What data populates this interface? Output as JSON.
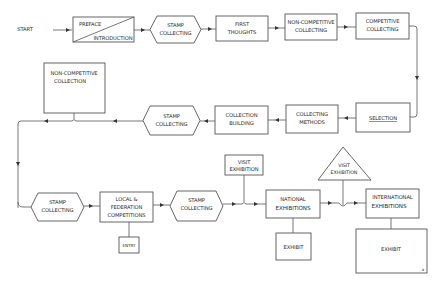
{
  "diagram": {
    "start": "START",
    "preface": {
      "top": "PREFACE",
      "bottom": "INTRODUCTION"
    },
    "stamp1": {
      "l1": "STAMP",
      "l2": "COLLECTING"
    },
    "first_thoughts": {
      "l1": "FIRST",
      "l2": "THOUGHTS"
    },
    "non_comp_collecting": {
      "l1": "NON-COMPETITIVE",
      "l2": "COLLECTING"
    },
    "comp_collecting": {
      "l1": "COMPETITIVE",
      "l2": "COLLECTING"
    },
    "selection": {
      "l1": "SELECTION"
    },
    "collecting_methods": {
      "l1": "COLLECTING",
      "l2": "METHODS"
    },
    "collection_building": {
      "l1": "COLLECTION",
      "l2": "BUILDING"
    },
    "stamp2": {
      "l1": "STAMP",
      "l2": "COLLECTING"
    },
    "non_comp_collection": {
      "l1": "NON-COMPETITIVE",
      "l2": "COLLECTION"
    },
    "stamp3": {
      "l1": "STAMP",
      "l2": "COLLECTING"
    },
    "local_federation": {
      "l1": "LOCAL      &",
      "l2": "FEDERATION",
      "l3": "COMPETITIONS"
    },
    "entry": {
      "l1": "ENTRY"
    },
    "stamp4": {
      "l1": "STAMP",
      "l2": "COLLECTING"
    },
    "visit_exhibition_box": {
      "l1": "VISIT",
      "l2": "EXHIBITION"
    },
    "national_exhibitions": {
      "l1": "NATIONAL",
      "l2": "EXHIBITIONS"
    },
    "exhibit_national": {
      "l1": "EXHIBIT"
    },
    "visit_exhibition_triangle": {
      "l1": "VISIT",
      "l2": "EXHIBITION"
    },
    "international_exhibitions": {
      "l1": "INTERNATIONAL",
      "l2": "EXHIBITIONS"
    },
    "exhibit_international": {
      "l1": "EXHIBIT"
    },
    "corner_mark": "a"
  },
  "colors": {
    "stroke": "#555555",
    "text": "#2a2a2a",
    "background": "#ffffff"
  }
}
